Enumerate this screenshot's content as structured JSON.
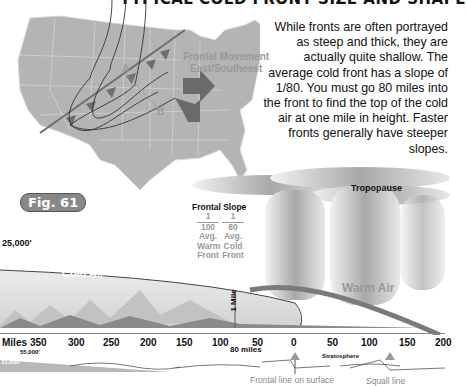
{
  "title": "TYPICAL COLD FRONT SIZE AND SHAPE",
  "paragraph": "While fronts are often portrayed as steep and thick, they are actually quite shallow. The average cold front has a slope of 1/80. You must go 80 miles into the front to find the top of the cold air at one mile in height. Faster fronts generally have steeper slopes.",
  "figure_label": "Fig. 61",
  "map": {
    "movement_label_1": "Frontal Movement",
    "movement_label_2": "East/Southeast",
    "point_a": "A",
    "point_b": "B"
  },
  "cross_section": {
    "tropopause": "Tropopause",
    "frontal_slope_title": "Frontal Slope",
    "warm_fraction_num": "1",
    "warm_fraction_den": "100",
    "warm_desc_1": "Avg.",
    "warm_desc_2": "Warm",
    "warm_desc_3": "Front",
    "cold_fraction_num": "1",
    "cold_fraction_den": "80",
    "cold_desc_1": "Avg.",
    "cold_desc_2": "Cold",
    "cold_desc_3": "Front",
    "altitude_label": "25,000'",
    "cold_air": "Cold Air",
    "warm_air": "Warm Air",
    "one_mile": "1 Mile"
  },
  "axis": {
    "label": "Miles",
    "ticks": [
      "350",
      "300",
      "250",
      "200",
      "150",
      "100",
      "50",
      "0",
      "50",
      "100",
      "150",
      "200"
    ],
    "marker": "80 miles"
  },
  "lower_strip": {
    "altitude_top": "55,000'",
    "altitude_left": "31,000'",
    "stratosphere": "Stratosphere",
    "frontal_line": "Frontal line on surface",
    "squall_line": "Squall line"
  },
  "colors": {
    "map_fill": "#b4b4b4",
    "front_line": "#6e6e6e",
    "text": "#111111",
    "label_gray": "#9a9a9a"
  }
}
